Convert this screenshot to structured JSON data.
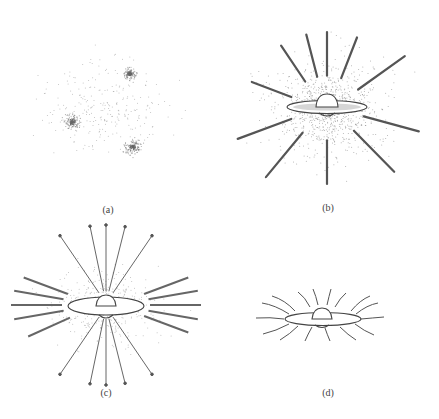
{
  "figure": {
    "panels": [
      {
        "id": "a",
        "label": "(a)",
        "description": "Three diffuse clumps of dispersed gas/dust particles",
        "label_pos": [
          108,
          204
        ]
      },
      {
        "id": "b",
        "label": "(b)",
        "description": "Central disk with bulge surrounded by dense particle cloud and inward-pointing streamers",
        "label_pos": [
          328,
          202
        ]
      },
      {
        "id": "c",
        "label": "(c)",
        "description": "Disk with bulge; arrows radiating outward and inward-pointing streams with sparser particles",
        "label_pos": [
          106,
          387
        ]
      },
      {
        "id": "d",
        "label": "(d)",
        "description": "Disk with bulge and short curved lines radiating outward",
        "label_pos": [
          328,
          387
        ]
      }
    ],
    "colors": {
      "ink": "#555555",
      "dots": "#777777",
      "background": "#ffffff"
    }
  }
}
